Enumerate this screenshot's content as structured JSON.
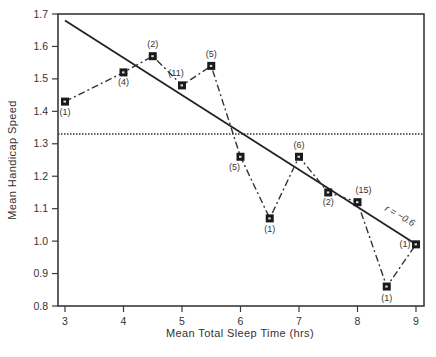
{
  "chart_data": {
    "type": "line",
    "title": "",
    "xlabel": "Mean Total Sleep Time (hrs)",
    "ylabel": "Mean Handicap Speed",
    "xlim": [
      3,
      9
    ],
    "ylim": [
      0.8,
      1.7
    ],
    "x_ticks": [
      "3",
      "4",
      "5",
      "6",
      "7",
      "8",
      "9"
    ],
    "y_ticks": [
      "0.8",
      "0.9",
      "1.0",
      "1.1",
      "1.2",
      "1.3",
      "1.4",
      "1.5",
      "1.6",
      "1.7"
    ],
    "grid": false,
    "legend": null,
    "series": [
      {
        "name": "Observed means",
        "style": "dash-dot line with square markers",
        "x": [
          3,
          4,
          4.5,
          5,
          5.5,
          6,
          6.5,
          7,
          7.5,
          8,
          8.5,
          9
        ],
        "y": [
          1.43,
          1.52,
          1.57,
          1.48,
          1.54,
          1.26,
          1.07,
          1.26,
          1.15,
          1.12,
          0.86,
          0.99
        ],
        "n_labels": [
          "(1)",
          "(4)",
          "(2)",
          "(11)",
          "(5)",
          "(5)",
          "(1)",
          "(6)",
          "(2)",
          "(15)",
          "(1)",
          "(1)"
        ]
      },
      {
        "name": "Regression line",
        "style": "solid",
        "x": [
          3,
          9
        ],
        "y": [
          1.68,
          0.99
        ]
      },
      {
        "name": "Overall mean",
        "style": "dotted",
        "x": [
          3,
          9
        ],
        "y": [
          1.33,
          1.33
        ]
      }
    ],
    "annotations": [
      {
        "text": "r = −0.6",
        "x": 8.7,
        "y": 1.07
      }
    ]
  }
}
